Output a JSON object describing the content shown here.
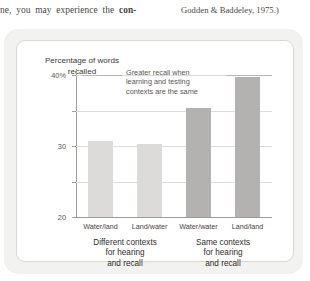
{
  "book_text": {
    "left_fragment_pre": "ne, you may experience the ",
    "left_fragment_bold": "con-",
    "citation": "Godden & Baddeley, 1975.)"
  },
  "chart_data": {
    "type": "bar",
    "title": "",
    "ylabel": "Percentage of words recalled",
    "xlabel": "",
    "categories": [
      "Water/land",
      "Land/water",
      "Water/water",
      "Land/land"
    ],
    "values": [
      21.5,
      20.5,
      30.8,
      39.5
    ],
    "bar_colors": [
      "#dcdbd9",
      "#dcdbd9",
      "#b3b2b0",
      "#b3b2b0"
    ],
    "ylim": [
      0,
      42
    ],
    "yticks": [
      0,
      10,
      20,
      30,
      40
    ],
    "ytick_labels": [
      "0",
      "10",
      "20",
      "30",
      "40%"
    ],
    "grid": true,
    "legend": "none",
    "annotations": [
      {
        "text": "Greater recall when learning and testing contexts are the same",
        "line1": "Greater recall when",
        "line2": "learning and testing",
        "line3": "contexts are the same"
      }
    ],
    "group_labels": [
      {
        "line1": "Different contexts",
        "line2": "for hearing",
        "line3": "and recall"
      },
      {
        "line1": "Same contexts",
        "line2": "for hearing",
        "line3": "and recall"
      }
    ]
  },
  "colors": {
    "panel_background": "#f2f2f0",
    "card_background": "#ffffff",
    "axis": "#9e9c99",
    "gridline": "#dedcd9",
    "bar_light": "#dcdbd9",
    "bar_dark": "#b3b2b0"
  }
}
